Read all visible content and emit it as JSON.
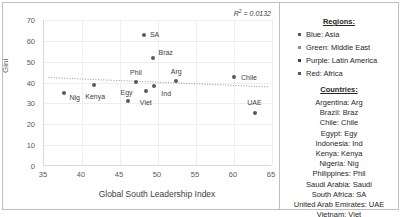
{
  "chart_data": {
    "type": "scatter",
    "title": "",
    "xlabel": "Global South Leadership Index",
    "ylabel": "Gini",
    "xlim": [
      35,
      65
    ],
    "ylim": [
      0,
      70
    ],
    "xticks": [
      35,
      40,
      45,
      50,
      55,
      60,
      65
    ],
    "yticks": [
      0,
      10,
      20,
      30,
      40,
      50,
      60,
      70
    ],
    "grid": true,
    "annotation": "R² = 0.0132",
    "annotation_prefix": "R",
    "annotation_sup": "2",
    "annotation_suffix": " = 0.0132",
    "trendline": {
      "type": "linear",
      "style": "dotted",
      "x0": 35.6,
      "y0": 42.4,
      "x1": 64.6,
      "y1": 37.9
    },
    "points": [
      {
        "label": "Nig",
        "x": 37.6,
        "y": 34.8,
        "lbl_dx": 11,
        "lbl_dy": 4
      },
      {
        "label": "Kenya",
        "x": 41.6,
        "y": 38.6,
        "lbl_dx": 1,
        "lbl_dy": 11
      },
      {
        "label": "Egy",
        "x": 46.0,
        "y": 31.4,
        "lbl_dx": -1,
        "lbl_dy": -9
      },
      {
        "label": "Phil",
        "x": 47.1,
        "y": 40.4,
        "lbl_dx": 0,
        "lbl_dy": -10
      },
      {
        "label": "SA",
        "x": 48.1,
        "y": 62.8,
        "lbl_dx": 11,
        "lbl_dy": -1
      },
      {
        "label": "Viet",
        "x": 48.4,
        "y": 35.8,
        "lbl_dx": 0,
        "lbl_dy": 11
      },
      {
        "label": "Braz",
        "x": 49.3,
        "y": 51.9,
        "lbl_dx": 13,
        "lbl_dy": -6
      },
      {
        "label": "Ind",
        "x": 49.5,
        "y": 38.2,
        "lbl_dx": 12,
        "lbl_dy": 7
      },
      {
        "label": "Arg",
        "x": 52.4,
        "y": 40.6,
        "lbl_dx": 0,
        "lbl_dy": -10
      },
      {
        "label": "Chile",
        "x": 60.0,
        "y": 42.5,
        "lbl_dx": 15,
        "lbl_dy": 0
      },
      {
        "label": "UAE",
        "x": 62.7,
        "y": 25.2,
        "lbl_dx": 0,
        "lbl_dy": -11
      }
    ]
  },
  "legend": {
    "regions_heading": "Regions:",
    "regions": [
      {
        "label": "Blue: Asia",
        "color": "#595959"
      },
      {
        "label": "Green: Middle East",
        "color": "#8c8c8c"
      },
      {
        "label": "Purple: Latin America",
        "color": "#404040"
      },
      {
        "label": "Red: Africa",
        "color": "#595959"
      }
    ],
    "countries_heading": "Countries:",
    "countries": [
      "Argentina: Arg",
      "Brazil: Braz",
      "Chile: Chile",
      "Egypt: Egy",
      "Indonesia: Ind",
      "Kenya: Kenya",
      "Nigeria: Nig",
      "Philippines: Phil",
      "Saudi Arabia: Saudi",
      "South Africa: SA",
      "United Arab Emirates: UAE",
      "Vietnam: Viet"
    ]
  },
  "colors": {
    "frame": "#bfbfbf",
    "gridline": "#efefef",
    "axis": "#d9d9d9",
    "marker": "#595959",
    "text": "#404040"
  }
}
